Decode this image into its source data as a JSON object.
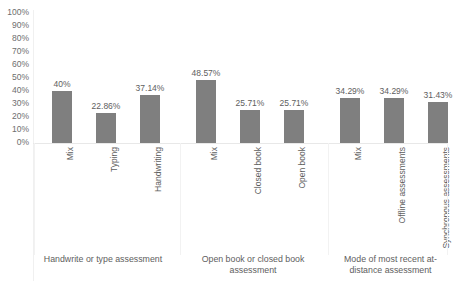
{
  "chart_data": {
    "type": "bar",
    "title": "",
    "subtitle": "",
    "xlabel": "",
    "ylabel": "",
    "ylim": [
      0,
      100
    ],
    "grid": false,
    "legend": "none",
    "y_tick_labels": [
      "100%",
      "90%",
      "80%",
      "70%",
      "60%",
      "50%",
      "40%",
      "30%",
      "20%",
      "10%",
      "0%"
    ],
    "y_tick_values": [
      100,
      90,
      80,
      70,
      60,
      50,
      40,
      30,
      20,
      10,
      0
    ],
    "bar_color": "#7f7f7f",
    "categories": [
      "Mix",
      "Typing",
      "Handwriting",
      "Mix",
      "Closed book",
      "Open book",
      "Mix",
      "Offline assessments",
      "Synchronous assessments"
    ],
    "values": [
      40,
      22.86,
      37.14,
      48.57,
      25.71,
      25.71,
      34.29,
      34.29,
      31.43
    ],
    "data_labels": [
      "40%",
      "22.86%",
      "37.14%",
      "48.57%",
      "25.71%",
      "25.71%",
      "34.29%",
      "34.29%",
      "31.43%"
    ],
    "groups": [
      {
        "label": "Handwrite or type assessment",
        "categories": [
          "Mix",
          "Typing",
          "Handwriting"
        ]
      },
      {
        "label": "Open book or closed book assessment",
        "categories": [
          "Mix",
          "Closed book",
          "Open book"
        ]
      },
      {
        "label": "Mode of most recent at-distance assessment",
        "categories": [
          "Mix",
          "Offline assessments",
          "Synchronous assessments"
        ]
      }
    ]
  }
}
